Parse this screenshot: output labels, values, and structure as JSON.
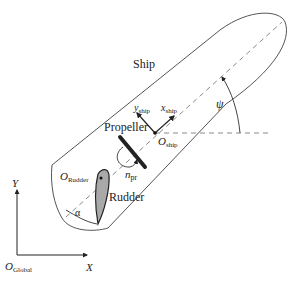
{
  "diagram": {
    "title_label": "Ship",
    "labels": {
      "ship": "Ship",
      "propeller": "Propeller",
      "rudder": "Rudder",
      "psi": "ψ",
      "alpha": "α",
      "y_ship_main": "y",
      "y_ship_sub": "ship",
      "x_ship_main": "x",
      "x_ship_sub": "ship",
      "o_ship_main": "O",
      "o_ship_sub": "ship",
      "o_rudder_main": "O",
      "o_rudder_sub": "Rudder",
      "n_pr_main": "n",
      "n_pr_sub": "pr",
      "global_y": "Y",
      "global_x": "X",
      "o_global_main": "O",
      "o_global_sub": "Global"
    },
    "colors": {
      "outline": "#555555",
      "dashed": "#8a8a8a",
      "rudder_fill": "#a9a9a9",
      "propeller": "#222222",
      "text": "#222222"
    }
  }
}
